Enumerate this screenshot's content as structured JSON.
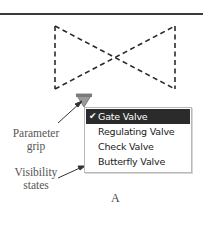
{
  "figure": {
    "letter": "A"
  },
  "symbol": {
    "type": "dashed-bowtie-valve",
    "stroke_color": "#2a2a2a"
  },
  "grip": {
    "fill": "#9a9a9a",
    "top_bar": "#7a7a7a"
  },
  "callouts": {
    "parameter_grip": "Parameter grip",
    "parameter_grip_line1": "Parameter",
    "parameter_grip_line2": "grip",
    "visibility_states": "Visibility states",
    "visibility_states_line1": "Visibility",
    "visibility_states_line2": "states"
  },
  "menu": {
    "items": [
      {
        "label": "Gate Valve",
        "selected": true,
        "check": "✔"
      },
      {
        "label": "Regulating Valve",
        "selected": false
      },
      {
        "label": "Check Valve",
        "selected": false
      },
      {
        "label": "Butterfly Valve",
        "selected": false
      }
    ],
    "selected_bg": "#2b2b2b"
  }
}
